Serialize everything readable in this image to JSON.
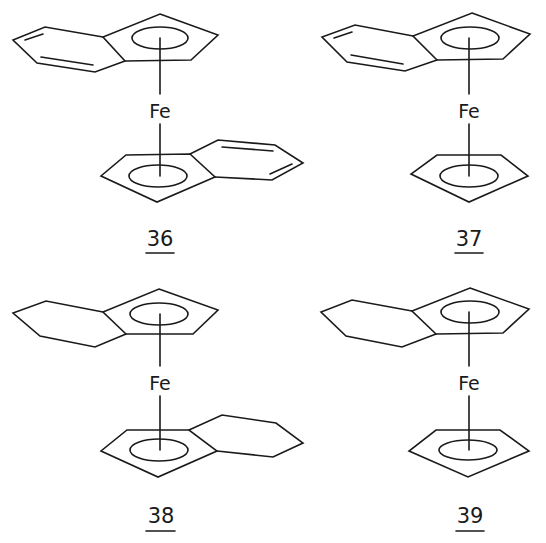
{
  "figure": {
    "type": "chemical-structures",
    "compounds": [
      {
        "id": "36",
        "label": "36",
        "metal": "Fe",
        "top_ligand": "indenyl",
        "bottom_ligand": "indenyl"
      },
      {
        "id": "37",
        "label": "37",
        "metal": "Fe",
        "top_ligand": "indenyl",
        "bottom_ligand": "cyclopentadienyl"
      },
      {
        "id": "38",
        "label": "38",
        "metal": "Fe",
        "top_ligand": "tetrahydroindenyl",
        "bottom_ligand": "tetrahydroindenyl"
      },
      {
        "id": "39",
        "label": "39",
        "metal": "Fe",
        "top_ligand": "tetrahydroindenyl",
        "bottom_ligand": "cyclopentadienyl"
      }
    ]
  },
  "colors": {
    "ink": "#1a1a1a",
    "background": "#ffffff"
  }
}
